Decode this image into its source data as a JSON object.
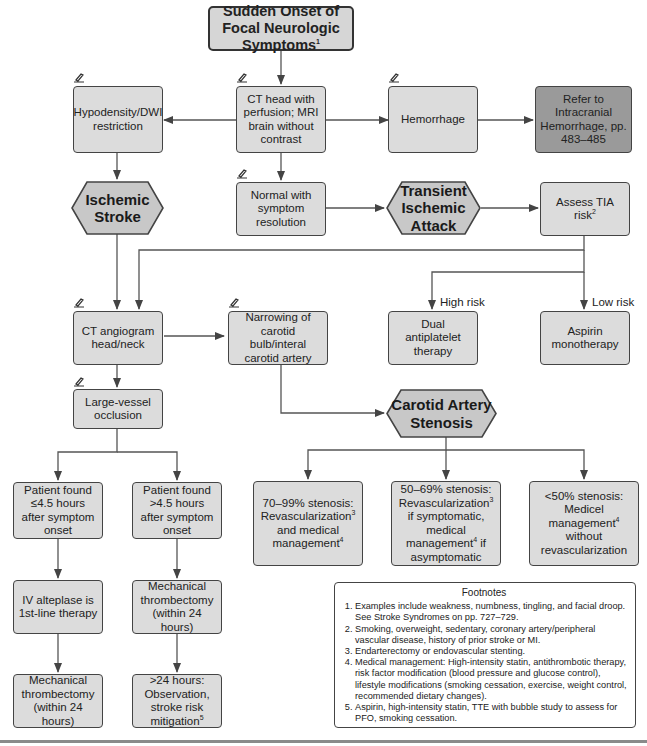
{
  "colors": {
    "box_fill": "#dcdcdc",
    "dark_box_fill": "#9a9a9a",
    "hex_fill": "#c8c8c8",
    "stroke": "#444444"
  },
  "nodes": {
    "start": {
      "text": "Sudden Onset of Focal Neurologic Symptoms",
      "sup": "1"
    },
    "imaging": {
      "text": "CT head with perfusion; MRI brain without contrast"
    },
    "hypodensity": {
      "text": "Hypodensity/DWI restriction"
    },
    "hemorrhage": {
      "text": "Hemorrhage"
    },
    "refer_ich": {
      "text": "Refer to Intracranial Hemorrhage, pp. 483–485"
    },
    "ischemic_stroke": {
      "line1": "Ischemic",
      "line2": "Stroke"
    },
    "normal": {
      "text": "Normal with symptom resolution"
    },
    "tia": {
      "line1": "Transient",
      "line2": "Ischemic",
      "line3": "Attack"
    },
    "assess_tia": {
      "text": "Assess TIA risk",
      "sup": "2"
    },
    "cta": {
      "text": "CT angiogram head/neck"
    },
    "narrowing": {
      "text": "Narrowing of carotid bulb/interal carotid artery"
    },
    "dapt": {
      "text": "Dual antiplatelet therapy"
    },
    "aspirin": {
      "text": "Aspirin monotherapy"
    },
    "lvo": {
      "text": "Large-vessel occlusion"
    },
    "carotid_stenosis": {
      "line1": "Carotid Artery",
      "line2": "Stenosis"
    },
    "early": {
      "text": "Patient found ≤4.5 hours after symptom onset"
    },
    "late": {
      "text": "Patient found >4.5 hours after symptom onset"
    },
    "sten_70": {
      "pre": "70–99% stenosis: Revascularization",
      "sup1": "3",
      "mid": " and medical management",
      "sup2": "4"
    },
    "sten_50": {
      "pre": "50–69% stenosis: Revascularization",
      "sup1": "3",
      "mid": " if symptomatic, medical management",
      "sup2": "4",
      "post": " if asymptomatic"
    },
    "sten_lt50": {
      "pre": "<50% stenosis: Medicel management",
      "sup1": "4",
      "post": " without revascularization"
    },
    "alteplase": {
      "text": "IV alteplase is 1st-line therapy"
    },
    "thrombectomy_late": {
      "text": "Mechanical thrombectomy (within 24 hours)"
    },
    "thrombectomy_early": {
      "text": "Mechanical thrombectomy (within 24 hours)"
    },
    "observation": {
      "text": ">24 hours: Observation, stroke risk mitigation",
      "sup": "5"
    }
  },
  "edge_labels": {
    "high_risk": "High risk",
    "low_risk": "Low risk"
  },
  "footnotes": {
    "title": "Footnotes",
    "items": [
      "Examples include weakness, numbness, tingling, and facial droop. See Stroke Syndromes on pp. 727–729.",
      "Smoking, overweight, sedentary, coronary artery/peripheral vascular disease, history of prior stroke or MI.",
      "Endarterectomy or endovascular stenting.",
      "Medical management: High-intensity statin, antithrombotic therapy, risk factor modification (blood pressure and glucose control), lifestyle modifications (smoking cessation, exercise, weight control, recommended dietary changes).",
      "Aspirin, high-intensity statin, TTE with bubble study to assess for PFO, smoking cessation."
    ]
  },
  "icons": {
    "pencil": "pencil-edit-icon"
  }
}
